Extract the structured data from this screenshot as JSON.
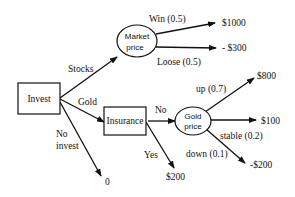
{
  "diagram": {
    "type": "decision-tree",
    "nodes": {
      "invest": {
        "label": "Invest",
        "kind": "decision"
      },
      "market_price": {
        "label_line1": "Market",
        "label_line2": "price",
        "kind": "chance"
      },
      "insurance": {
        "label": "Insurance",
        "kind": "decision"
      },
      "gold_price": {
        "label_line1": "Gold",
        "label_line2": "price",
        "kind": "chance"
      }
    },
    "edges": {
      "stocks": {
        "label": "Stocks",
        "from": "Invest",
        "to": "Market price"
      },
      "gold": {
        "label": "Gold",
        "from": "Invest",
        "to": "Insurance"
      },
      "no_invest": {
        "label_line1": "No",
        "label_line2": "invest",
        "from": "Invest",
        "to": "0"
      },
      "win": {
        "label": "Win (0.5)",
        "from": "Market price",
        "to": "$1000"
      },
      "loose": {
        "label": "Loose (0.5)",
        "from": "Market price",
        "to": "- $300"
      },
      "no": {
        "label": "No",
        "from": "Insurance",
        "to": "Gold price"
      },
      "yes": {
        "label": "Yes",
        "from": "Insurance",
        "to": "$200"
      },
      "up": {
        "label": "up (0.7)",
        "from": "Gold price",
        "to": "$800"
      },
      "stable": {
        "label": "stable (0.2)",
        "from": "Gold price",
        "to": "$100"
      },
      "down": {
        "label": "down (0.1)",
        "from": "Gold price",
        "to": "-$200"
      }
    },
    "outcomes": {
      "win": "$1000",
      "loose": "- $300",
      "up": "$800",
      "stable": "$100",
      "down": "-$200",
      "insured": "$200",
      "no_invest": "0"
    }
  }
}
